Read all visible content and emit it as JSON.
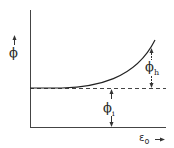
{
  "diagram": {
    "type": "schematic plot",
    "y_axis_label": "ϕ",
    "x_axis_label": {
      "base": "ε",
      "subscript": "o"
    },
    "annotations": [
      {
        "id": "phi_h",
        "base": "ϕ",
        "subscript": "h",
        "meaning": "vertical distance from dashed baseline up to curve end"
      },
      {
        "id": "phi_i",
        "base": "ϕ",
        "subscript": "i",
        "meaning": "vertical distance from x-axis up to dashed baseline"
      }
    ],
    "curve": {
      "description": "flat at baseline then rising exponentially",
      "shape": "exponential-increase"
    },
    "baseline": {
      "style": "dashed"
    },
    "colors": {
      "line": "#333333",
      "background": "#ffffff"
    }
  }
}
